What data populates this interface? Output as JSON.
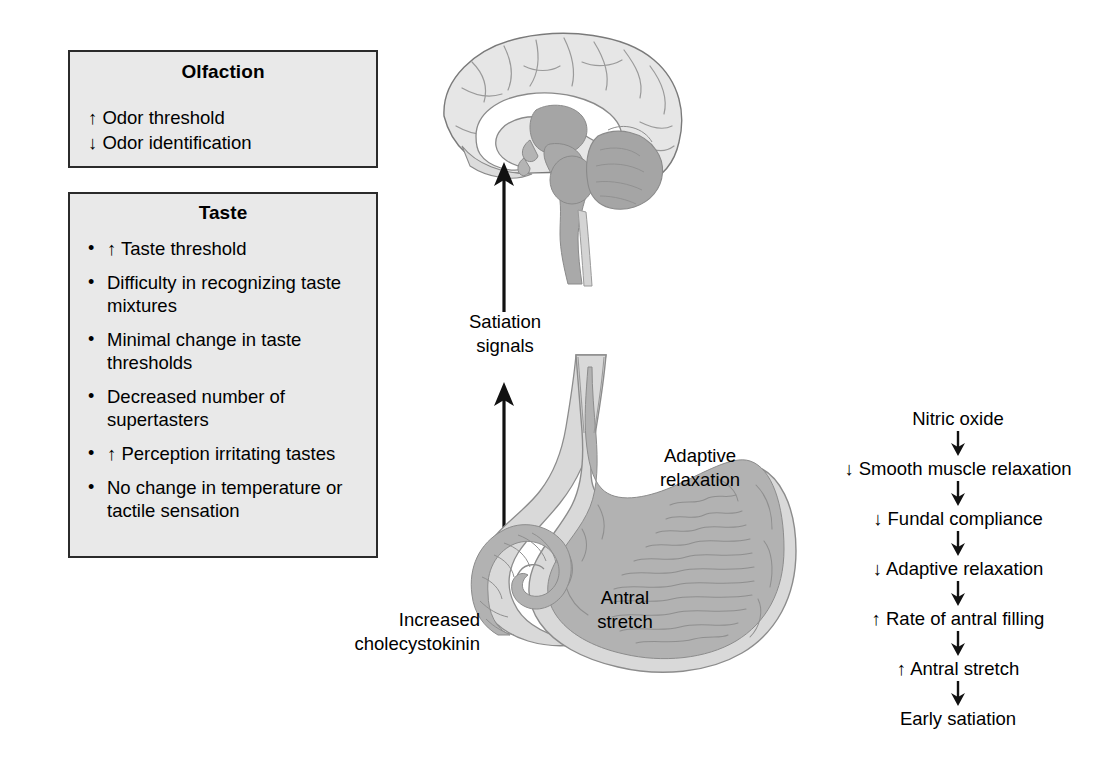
{
  "boxes": {
    "olfaction": {
      "title": "Olfaction",
      "lines": [
        "↑ Odor threshold",
        "↓ Odor identification"
      ]
    },
    "taste": {
      "title": "Taste",
      "bullet": "•",
      "items": [
        "↑ Taste threshold",
        "Difficulty in recognizing taste mixtures",
        "Minimal change in taste thresholds",
        "Decreased number of supertasters",
        "↑ Perception irritating tastes",
        "No change in temperature or tactile sensation"
      ]
    }
  },
  "labels": {
    "satiation_signals": "Satiation\nsignals",
    "increased_cck": "Increased\ncholecystokinin",
    "adaptive_relaxation": "Adaptive\nrelaxation",
    "antral_stretch": "Antral\nstretch"
  },
  "cascade": {
    "steps": [
      "Nitric oxide",
      "↓ Smooth muscle relaxation",
      "↓ Fundal compliance",
      "↓ Adaptive relaxation",
      "↑ Rate of antral filling",
      "↑ Antral stretch",
      "Early satiation"
    ]
  },
  "artwork": {
    "brain_name": "brain-midsagittal-illustration",
    "stomach_name": "stomach-anatomy-illustration"
  },
  "colors": {
    "box_fill": "#e9e9e9",
    "box_border": "#2b2b2b",
    "text": "#000000",
    "brain_cortex": "#e3e3e3",
    "brain_stem": "#a8a8a8",
    "stomach_wall": "#d6d6d6",
    "stomach_lumen": "#b0b0b0",
    "outline": "#6e6e6e"
  }
}
